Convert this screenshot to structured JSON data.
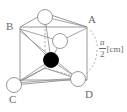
{
  "figure": {
    "type": "crystal-lattice-diagram",
    "colors": {
      "line": "#8d8d8d",
      "hidden_line": "#9a9a9a",
      "atom_open_fill": "#ffffff",
      "atom_open_stroke": "#8d8d8d",
      "atom_filled_fill": "#000000",
      "text": "#6a6a6a",
      "background": "#ffffff"
    },
    "vertex_labels": {
      "A": "A",
      "B": "B",
      "C": "C",
      "D": "D"
    },
    "dimension": {
      "numerator": "a",
      "denominator": "2",
      "unit": "[cm]",
      "full_text": "a/2 [cm]"
    },
    "atoms": [
      {
        "id": "atom-top",
        "kind": "open",
        "cx": 45,
        "cy": 17,
        "r": 7.5
      },
      {
        "id": "atom-middle",
        "kind": "open",
        "cx": 60,
        "cy": 41,
        "r": 7.5
      },
      {
        "id": "atom-center",
        "kind": "filled",
        "cx": 51,
        "cy": 60,
        "r": 7.5
      },
      {
        "id": "atom-corner-c",
        "kind": "open",
        "cx": 14,
        "cy": 85,
        "r": 7.5
      },
      {
        "id": "atom-corner-d",
        "kind": "open",
        "cx": 78,
        "cy": 79,
        "r": 7.5
      }
    ]
  }
}
